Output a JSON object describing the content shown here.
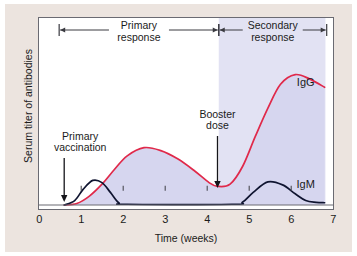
{
  "figure": {
    "background": "#ffffff",
    "panel_color": "#ece4df",
    "plot_background": "#ffffff",
    "frame_color": "#6a6a72"
  },
  "chart_data": {
    "type": "line",
    "title": "",
    "xlabel": "Time (weeks)",
    "ylabel": "Serum titer of antibodies",
    "xlim": [
      0,
      7
    ],
    "ylim": [
      0,
      1
    ],
    "xticks": [
      "0",
      "1",
      "2",
      "3",
      "4",
      "5",
      "6",
      "7"
    ],
    "yticks": [],
    "grid": false,
    "legend": "inline-labels",
    "fill_color": "#d6d6ef",
    "series": [
      {
        "name": "IgG",
        "color": "#e0294a",
        "label": "IgG",
        "label_x_weeks": 6.35,
        "filled": true,
        "points": [
          {
            "x": 0.6,
            "y": 0.0
          },
          {
            "x": 0.9,
            "y": 0.01
          },
          {
            "x": 1.2,
            "y": 0.06
          },
          {
            "x": 1.5,
            "y": 0.14
          },
          {
            "x": 1.8,
            "y": 0.24
          },
          {
            "x": 2.1,
            "y": 0.33
          },
          {
            "x": 2.5,
            "y": 0.385
          },
          {
            "x": 2.9,
            "y": 0.365
          },
          {
            "x": 3.3,
            "y": 0.31
          },
          {
            "x": 3.7,
            "y": 0.23
          },
          {
            "x": 4.05,
            "y": 0.15
          },
          {
            "x": 4.25,
            "y": 0.125
          },
          {
            "x": 4.55,
            "y": 0.14
          },
          {
            "x": 4.85,
            "y": 0.26
          },
          {
            "x": 5.15,
            "y": 0.46
          },
          {
            "x": 5.45,
            "y": 0.65
          },
          {
            "x": 5.75,
            "y": 0.81
          },
          {
            "x": 6.1,
            "y": 0.875
          },
          {
            "x": 6.45,
            "y": 0.845
          },
          {
            "x": 6.8,
            "y": 0.79
          }
        ]
      },
      {
        "name": "IgM",
        "color": "#0f1430",
        "label": "IgM",
        "label_x_weeks": 6.35,
        "filled": false,
        "points": [
          {
            "x": 0.6,
            "y": 0.0
          },
          {
            "x": 0.85,
            "y": 0.03
          },
          {
            "x": 1.05,
            "y": 0.105
          },
          {
            "x": 1.28,
            "y": 0.165
          },
          {
            "x": 1.5,
            "y": 0.15
          },
          {
            "x": 1.7,
            "y": 0.085
          },
          {
            "x": 1.9,
            "y": 0.015
          },
          {
            "x": 2.1,
            "y": 0.005
          },
          {
            "x": 4.6,
            "y": 0.005
          },
          {
            "x": 4.85,
            "y": 0.02
          },
          {
            "x": 5.1,
            "y": 0.085
          },
          {
            "x": 5.45,
            "y": 0.155
          },
          {
            "x": 5.8,
            "y": 0.135
          },
          {
            "x": 6.1,
            "y": 0.075
          },
          {
            "x": 6.35,
            "y": 0.03
          },
          {
            "x": 6.6,
            "y": 0.018
          },
          {
            "x": 6.8,
            "y": 0.015
          }
        ]
      }
    ],
    "phase_bars": [
      {
        "id": "primary",
        "label_line1": "Primary",
        "label_line2": "response",
        "x_start_weeks": 0.48,
        "x_end_weeks": 4.28
      },
      {
        "id": "secondary",
        "label_line1": "Secondary",
        "label_line2": "response",
        "x_start_weeks": 4.28,
        "x_end_weeks": 6.85
      }
    ],
    "annotations": [
      {
        "id": "primary-vaccination",
        "label_line1": "Primary",
        "label_line2": "vaccination",
        "x_weeks": 0.6,
        "arrow": "down"
      },
      {
        "id": "booster-dose",
        "label_line1": "Booster",
        "label_line2": "dose",
        "x_weeks": 4.25,
        "arrow": "down"
      }
    ],
    "secondary_shading_start_weeks": 4.28
  }
}
